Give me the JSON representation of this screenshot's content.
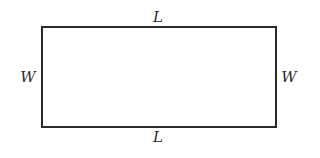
{
  "diagram": {
    "shape": "rectangle",
    "labels": {
      "top": "L",
      "bottom": "L",
      "left": "W",
      "right": "W"
    },
    "stroke_color": "#2a2a2a"
  }
}
